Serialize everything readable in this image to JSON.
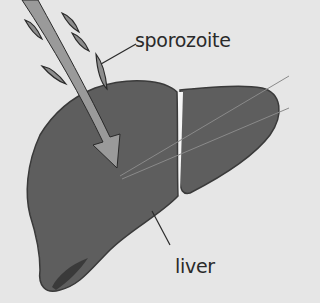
{
  "diagram": {
    "labels": {
      "sporozoite": "sporozoite",
      "liver": "liver"
    },
    "colors": {
      "background": "#e6e6e6",
      "liver_fill": "#5e5e5e",
      "liver_outline": "#3a3a3a",
      "arrow_fill": "#9a9a9a",
      "sporozoite_fill": "#8c8c8c",
      "gallbladder": "#3a3a3a",
      "label_text": "#2a2a2a"
    },
    "elements": [
      {
        "name": "liver",
        "type": "organ"
      },
      {
        "name": "sporozoite-arrow",
        "type": "arrow",
        "direction": "down-right into liver"
      },
      {
        "name": "sporozoites",
        "type": "parasite-cells",
        "count": 5
      },
      {
        "name": "gallbladder",
        "type": "organ-detail"
      }
    ]
  }
}
